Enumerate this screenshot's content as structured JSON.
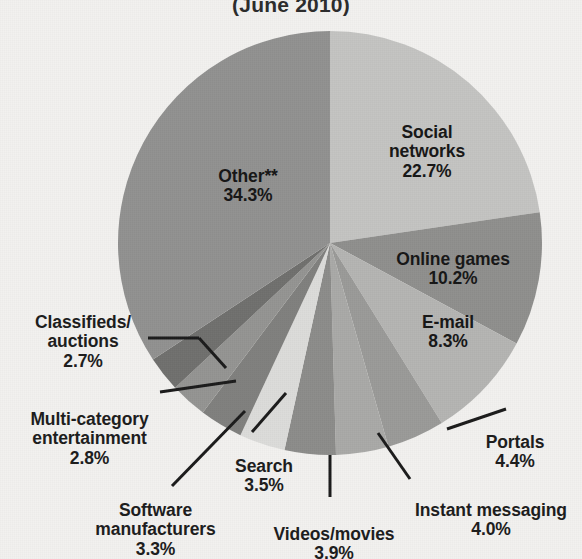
{
  "chart_data": {
    "type": "pie",
    "title": "(June 2010)",
    "xlabel": "",
    "ylabel": "",
    "legend_position": "none",
    "grid": false,
    "categories": [
      "Social networks",
      "Online games",
      "E-mail",
      "Portals",
      "Instant messaging",
      "Videos/movies",
      "Search",
      "Software manufacturers",
      "Multi-category entertainment",
      "Classifieds/ auctions",
      "Other**"
    ],
    "values": [
      22.7,
      10.2,
      8.3,
      4.4,
      4.0,
      3.9,
      3.5,
      3.3,
      2.8,
      2.7,
      34.3
    ],
    "value_labels": [
      "22.7%",
      "10.2%",
      "8.3%",
      "4.4%",
      "4.0%",
      "3.9%",
      "3.5%",
      "3.3%",
      "2.8%",
      "2.7%",
      "34.3%"
    ],
    "slice_colors": [
      "#c3c3c1",
      "#8f8f8d",
      "#b4b4b2",
      "#9a9a98",
      "#a9a9a7",
      "#8c8c8a",
      "#dcdcda",
      "#7f7f7d",
      "#949492",
      "#6f6f6d",
      "#919190"
    ],
    "start_angle_deg": 0,
    "direction": "clockwise",
    "units": "percent",
    "total": 100.0
  },
  "title": {
    "text": "(June 2010)"
  },
  "labels": {
    "social_networks": {
      "name": "Social\nnetworks",
      "value": "22.7%"
    },
    "online_games": {
      "name": "Online games",
      "value": "10.2%"
    },
    "email": {
      "name": "E-mail",
      "value": "8.3%"
    },
    "portals": {
      "name": "Portals",
      "value": "4.4%"
    },
    "instant_messaging": {
      "name": "Instant messaging",
      "value": "4.0%"
    },
    "videos_movies": {
      "name": "Videos/movies",
      "value": "3.9%"
    },
    "search": {
      "name": "Search",
      "value": "3.5%"
    },
    "software": {
      "name": "Software\nmanufacturers",
      "value": "3.3%"
    },
    "multicategory": {
      "name": "Multi-category\nentertainment",
      "value": "2.8%"
    },
    "classifieds": {
      "name": "Classifieds/\nauctions",
      "value": "2.7%"
    },
    "other": {
      "name": "Other**",
      "value": "34.3%"
    }
  },
  "colors": {
    "background": "#f2f1ef",
    "text": "#1b1b1b",
    "leader_line": "#1a1a1a"
  }
}
